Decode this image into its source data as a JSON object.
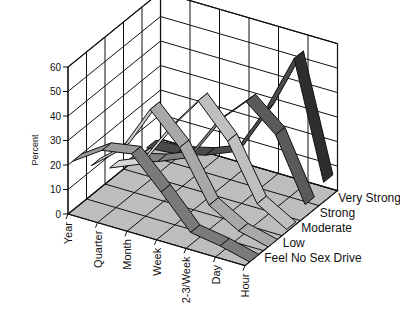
{
  "chart_data": {
    "type": "ribbon-3d",
    "title": "",
    "ylabel": "Percent",
    "xlabel": "",
    "ylim": [
      0,
      60
    ],
    "yticks": [
      "0",
      "10",
      "20",
      "30",
      "40",
      "50",
      "60"
    ],
    "categories": [
      "Year",
      "Quarter",
      "Month",
      "Week",
      "2-3/Week",
      "Day",
      "Hour"
    ],
    "series": [
      {
        "name": "Feel No Sex Drive",
        "values": [
          20,
          28,
          30,
          18,
          5,
          3,
          0
        ]
      },
      {
        "name": "Low",
        "values": [
          12,
          22,
          42,
          30,
          10,
          3,
          0
        ]
      },
      {
        "name": "Moderate",
        "values": [
          5,
          10,
          28,
          43,
          30,
          8,
          1
        ]
      },
      {
        "name": "Strong",
        "values": [
          2,
          5,
          10,
          28,
          40,
          30,
          5
        ]
      },
      {
        "name": "Very Strong",
        "values": [
          1,
          2,
          5,
          10,
          30,
          55,
          8
        ]
      }
    ],
    "grid": true,
    "legend_position": "right-depth-axis"
  }
}
